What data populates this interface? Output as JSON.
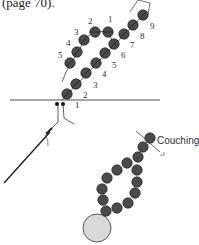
{
  "caption": "(page 70).",
  "diagram_top": {
    "row_a_labels": [
      "1",
      "2",
      "3",
      "4",
      "5",
      "6",
      "7",
      "8",
      "9"
    ],
    "row_b_labels": [
      "5",
      "4",
      "3",
      "2",
      "1"
    ],
    "bead_color": "#4a4a4a"
  },
  "diagram_bottom": {
    "callout_label": "Couching",
    "bead_color": "#4a4a4a",
    "large_bead_color": "#d9d9d9"
  }
}
